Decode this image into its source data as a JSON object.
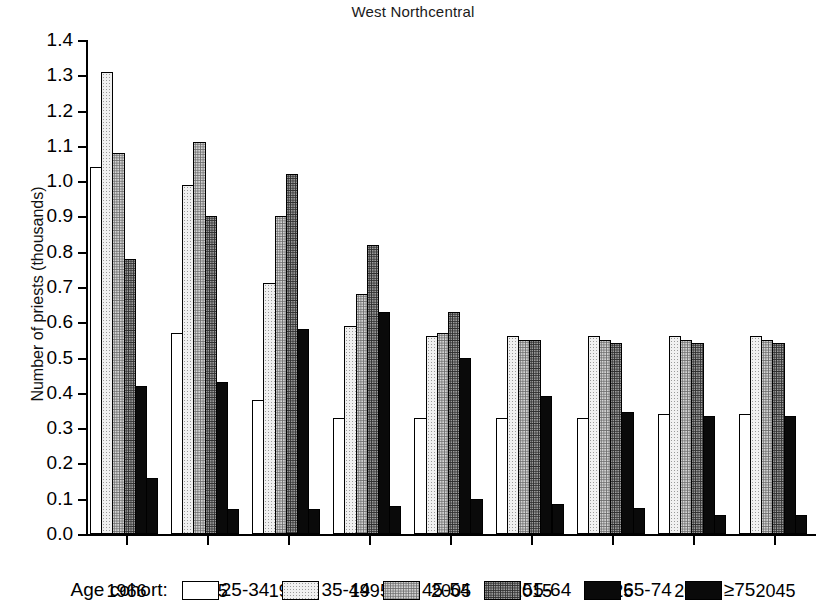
{
  "chart_data": {
    "type": "bar",
    "title": "West Northcentral",
    "xlabel": "",
    "ylabel": "Number of priests (thousands)",
    "categories": [
      "1966",
      "1975",
      "1985",
      "1995",
      "2005",
      "2015",
      "2025",
      "2035",
      "2045"
    ],
    "ylim": [
      0.0,
      1.4
    ],
    "ytick_labels": [
      "0.0",
      "0.1",
      "0.2",
      "0.3",
      "0.4",
      "0.5",
      "0.6",
      "0.7",
      "0.8",
      "0.9",
      "1.0",
      "1.1",
      "1.2",
      "1.3",
      "1.4"
    ],
    "ytick_values": [
      0.0,
      0.1,
      0.2,
      0.3,
      0.4,
      0.5,
      0.6,
      0.7,
      0.8,
      0.9,
      1.0,
      1.1,
      1.2,
      1.3,
      1.4
    ],
    "grid": false,
    "legend_position": "bottom",
    "legend_title": "Age cohort:",
    "series": [
      {
        "name": "25-34",
        "fill": "white",
        "values": [
          1.04,
          0.57,
          0.38,
          0.33,
          0.33,
          0.33,
          0.33,
          0.34,
          0.34
        ]
      },
      {
        "name": "35-44",
        "fill": "light-stipple",
        "values": [
          1.31,
          0.99,
          0.71,
          0.59,
          0.56,
          0.56,
          0.56,
          0.56,
          0.56
        ]
      },
      {
        "name": "45-54",
        "fill": "medium-stipple",
        "values": [
          1.08,
          1.11,
          0.9,
          0.68,
          0.57,
          0.55,
          0.55,
          0.55,
          0.55
        ]
      },
      {
        "name": "55-64",
        "fill": "dark-stipple",
        "values": [
          0.78,
          0.9,
          1.02,
          0.82,
          0.63,
          0.55,
          0.54,
          0.54,
          0.54
        ]
      },
      {
        "name": "65-74",
        "fill": "very-dark-stipple",
        "values": [
          0.42,
          0.43,
          0.58,
          0.63,
          0.5,
          0.39,
          0.345,
          0.335,
          0.335
        ]
      },
      {
        "name": "≥75",
        "fill": "black",
        "values": [
          0.16,
          0.07,
          0.07,
          0.08,
          0.1,
          0.085,
          0.075,
          0.055,
          0.055
        ]
      }
    ]
  },
  "legend": {
    "title": "Age cohort:",
    "items": [
      {
        "label": "25-34"
      },
      {
        "label": "35-44"
      },
      {
        "label": "45-54"
      },
      {
        "label": "55-64"
      },
      {
        "label": "65-74"
      },
      {
        "label": "≥75"
      }
    ]
  },
  "axis": {
    "y_title": "Number of priests (thousands)"
  }
}
